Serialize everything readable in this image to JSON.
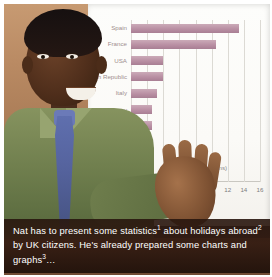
{
  "figure": {
    "kind": "photo-with-chart",
    "caption": {
      "segments": [
        {
          "text": "Nat has to present some statistics"
        },
        {
          "sup": "1"
        },
        {
          "text": " about holidays abroad"
        },
        {
          "sup": "2"
        },
        {
          "text": " by UK citizens. He's already prepared some charts and graphs"
        },
        {
          "sup": "3"
        },
        {
          "text": "…"
        }
      ],
      "plain": "Nat has to present some statistics1 about holidays abroad2 by UK citizens. He's already prepared some charts and graphs3…"
    }
  },
  "chart_data": {
    "type": "bar",
    "orientation": "horizontal",
    "title": "",
    "subtitle": "",
    "xlabel": "Visits (millions)",
    "ylabel": "",
    "legend": [
      "Visits (millions)"
    ],
    "legend_position": "inside-bottom-right",
    "grid": true,
    "xlim": [
      0,
      16
    ],
    "xticks": [
      0,
      2,
      4,
      6,
      8,
      10,
      12,
      14,
      16
    ],
    "xtick_labels": [
      "0",
      "2",
      "4",
      "6",
      "8",
      "10",
      "12",
      "14",
      "16"
    ],
    "categories": [
      "Spain",
      "France",
      "USA",
      "Irish Republic",
      "Italy",
      "Germany",
      "Portugal",
      "Greece",
      "Netherlands",
      "Turkey"
    ],
    "values": [
      13.4,
      10.5,
      4.0,
      4.0,
      3.2,
      2.6,
      2.6,
      2.2,
      2.2,
      2.2
    ],
    "series": [
      {
        "name": "Visits (millions)",
        "color": "#b98fa3",
        "values": [
          13.4,
          10.5,
          4.0,
          4.0,
          3.2,
          2.6,
          2.6,
          2.2,
          2.2,
          2.2
        ]
      }
    ]
  },
  "scene": {
    "presenter_name": "Nat",
    "board_label": "whiteboard-with-chart",
    "colors": {
      "bar": "#b98fa3",
      "grid": "#dcdad4",
      "board": "#fbfaf7",
      "shirt": "#6f7e4d",
      "tie": "#56649f",
      "caption_band": "#34201a"
    }
  }
}
